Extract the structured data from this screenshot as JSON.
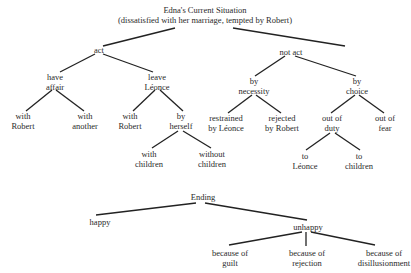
{
  "tree1": {
    "root": {
      "line1": "Edna's Current Situation",
      "line2": "(dissatisfied with her marriage, tempted by Robert)"
    },
    "act": {
      "label": "act",
      "have_affair": {
        "line1": "have",
        "line2": "affair",
        "with_robert": {
          "line1": "with",
          "line2": "Robert"
        },
        "with_another": {
          "line1": "with",
          "line2": "another"
        }
      },
      "leave_leonce": {
        "line1": "leave",
        "line2": "Léonce",
        "with_robert": {
          "line1": "with",
          "line2": "Robert"
        },
        "by_herself": {
          "line1": "by",
          "line2": "herself",
          "with_children": {
            "line1": "with",
            "line2": "children"
          },
          "without_children": {
            "line1": "without",
            "line2": "children"
          }
        }
      }
    },
    "not_act": {
      "label": "not act",
      "by_necessity": {
        "line1": "by",
        "line2": "necessity",
        "restrained": {
          "line1": "restrained",
          "line2": "by Léonce"
        },
        "rejected": {
          "line1": "rejected",
          "line2": "by Robert"
        }
      },
      "by_choice": {
        "line1": "by",
        "line2": "choice",
        "out_of_duty": {
          "line1": "out of",
          "line2": "duty",
          "to_leonce": {
            "line1": "to",
            "line2": "Léonce"
          },
          "to_children": {
            "line1": "to",
            "line2": "children"
          }
        },
        "out_of_fear": {
          "line1": "out of",
          "line2": "fear"
        }
      }
    }
  },
  "tree2": {
    "root": "Ending",
    "happy": "happy",
    "unhappy": {
      "label": "unhappy",
      "guilt": {
        "line1": "because of",
        "line2": "guilt"
      },
      "rejection": {
        "line1": "because of",
        "line2": "rejection"
      },
      "disillusionment": {
        "line1": "because of",
        "line2": "disillusionment"
      }
    }
  }
}
